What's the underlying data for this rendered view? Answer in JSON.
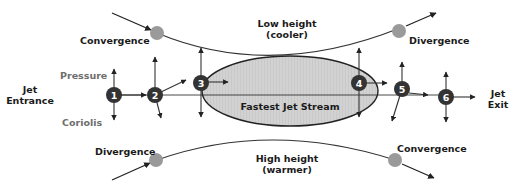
{
  "diagram": {
    "top_curve": {
      "label_line1": "Low height",
      "label_line2": "(cooler)",
      "left_label": "Convergence",
      "right_label": "Divergence"
    },
    "bottom_curve": {
      "label_line1": "High height",
      "label_line2": "(warmer)",
      "left_label": "Divergence",
      "right_label": "Convergence"
    },
    "jet_entrance": {
      "line1": "Jet",
      "line2": "Entrance"
    },
    "jet_exit": {
      "line1": "Jet",
      "line2": "Exit"
    },
    "force_labels": {
      "pressure": "Pressure",
      "coriolis": "Coriolis"
    },
    "jet_core_label": "Fastest Jet Stream",
    "points": [
      "1",
      "2",
      "3",
      "4",
      "5",
      "6"
    ],
    "colors": {
      "point_fill": "#333333",
      "marker_gray": "#9a9a9a",
      "jet_core_fill": "#cfcfcf",
      "line": "#222222",
      "force_label": "#6e6e6e"
    }
  }
}
